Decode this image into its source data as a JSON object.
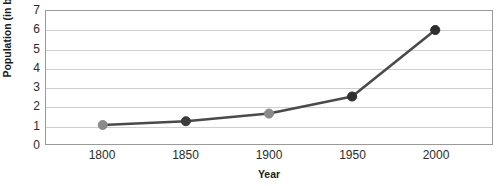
{
  "chart_data": {
    "type": "line",
    "title": "World Population",
    "title_clipped": true,
    "xlabel": "Year",
    "ylabel": "Population (in billions)",
    "x": [
      1800,
      1850,
      1900,
      1950,
      2000
    ],
    "x_tick_labels": [
      "1800",
      "1850",
      "1900",
      "1950",
      "2000"
    ],
    "values": [
      1.0,
      1.2,
      1.6,
      2.5,
      6.0
    ],
    "series": [
      {
        "name": "Population (in billions)",
        "values": [
          1.0,
          1.2,
          1.6,
          2.5,
          6.0
        ]
      }
    ],
    "y_tick_labels": [
      "0",
      "1",
      "2",
      "3",
      "4",
      "5",
      "6",
      "7"
    ],
    "y_ticks": [
      0,
      1,
      2,
      3,
      4,
      5,
      6,
      7
    ],
    "ylim": [
      0,
      7
    ],
    "xlim": [
      1800,
      2000
    ],
    "grid": "horizontal",
    "legend": "none",
    "marker": "circle",
    "marker_colors": [
      "#8a8a8a",
      "#3b3b3b",
      "#8a8a8a",
      "#303030",
      "#2e2e2e"
    ],
    "line_color": "#4a4a4a",
    "gridline_color": "#cfcfcf",
    "frame_color": "#9a9a9a",
    "text_color": "#2b2b2b",
    "background": "#ffffff"
  }
}
